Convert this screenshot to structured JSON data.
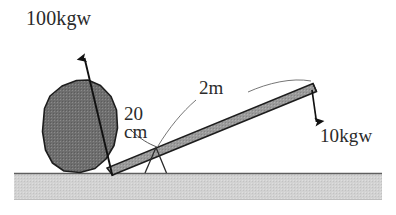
{
  "figure": {
    "labels": {
      "load_force": "100kgw",
      "lever_length": "2m",
      "effort_arm_line1": "20",
      "effort_arm_line2": "cm",
      "effort_force": "10kgw"
    },
    "colors": {
      "rock_fill": "#6e6e6e",
      "rock_stroke": "#1d1d1d",
      "lever_fill": "#989898",
      "lever_stroke": "#1d1d1d",
      "ground_fill": "#cfcfcf",
      "ground_stroke": "#6b6b6b",
      "arrow_stroke": "#111111",
      "leader_stroke": "#555555",
      "text_color": "#2b2b2b",
      "background": "#ffffff"
    },
    "elements": {
      "rock": "boulder-polygon",
      "lever": "lever-bar",
      "fulcrum": "triangular-fulcrum",
      "ground": "ground-strip",
      "load_arrow": "upward-arrow-100kgw",
      "effort_arrow": "downward-arrow-10kgw",
      "lever_length_leader": "leader-line-2m",
      "effort_arm_leader": "leader-line-20cm"
    }
  }
}
